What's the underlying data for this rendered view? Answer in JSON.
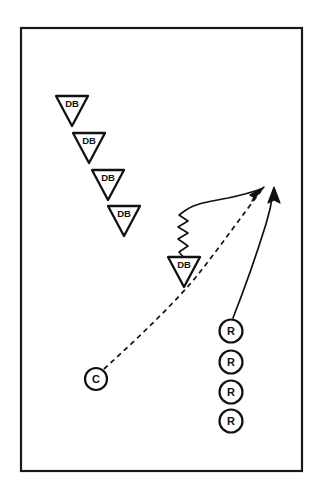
{
  "diagram": {
    "type": "play-diagram",
    "canvas": {
      "width": 317,
      "height": 494,
      "background": "#ffffff"
    },
    "border": {
      "x": 20,
      "y": 27,
      "width": 283,
      "height": 445,
      "color": "#1a1a1a",
      "stroke_width": 2.2
    },
    "ink_color": "#111111",
    "defensive_backs": [
      {
        "label": "DB",
        "cx": 72,
        "cy": 110,
        "half_width": 16,
        "height": 30
      },
      {
        "label": "DB",
        "cx": 89,
        "cy": 147,
        "half_width": 16,
        "height": 30
      },
      {
        "label": "DB",
        "cx": 108,
        "cy": 184,
        "half_width": 16,
        "height": 30
      },
      {
        "label": "DB",
        "cx": 124,
        "cy": 220,
        "half_width": 16,
        "height": 30
      },
      {
        "label": "DB",
        "cx": 184,
        "cy": 271,
        "half_width": 16,
        "height": 30
      }
    ],
    "receivers": [
      {
        "label": "R",
        "cx": 231,
        "cy": 331,
        "r": 12.5
      },
      {
        "label": "R",
        "cx": 231,
        "cy": 362,
        "r": 12.5
      },
      {
        "label": "R",
        "cx": 231,
        "cy": 392,
        "r": 12.5
      },
      {
        "label": "R",
        "cx": 231,
        "cy": 421,
        "r": 12.5
      }
    ],
    "coach": {
      "label": "C",
      "cx": 96,
      "cy": 379,
      "r": 12
    },
    "routes": [
      {
        "name": "ball-flight-dashed",
        "style": "dashed",
        "from": "C",
        "to": "target-left",
        "dash": "5,4",
        "path": "M 104 369 C 140 336, 178 300, 200 272 C 222 244, 244 213, 261 191"
      },
      {
        "name": "db-reaction-squiggle",
        "style": "zigzag-then-curve",
        "from": "DB-5",
        "to": "target-left",
        "path": "M 185 259 L 179 252 L 188 246 L 178 239 L 188 233 L 178 227 L 188 221 L 179 215 L 186 210 C 196 203, 210 202, 226 199 C 240 196, 252 192, 261 189"
      },
      {
        "name": "receiver-release-curve",
        "style": "solid",
        "from": "R-1",
        "to": "target-right",
        "path": "M 233 318 C 243 292, 256 254, 266 224 C 270 211, 272 200, 273 192"
      }
    ],
    "arrowheads": [
      {
        "name": "target-left",
        "x": 263,
        "y": 189,
        "angle": -52
      },
      {
        "name": "target-right",
        "x": 274,
        "y": 190,
        "angle": -85
      }
    ]
  }
}
